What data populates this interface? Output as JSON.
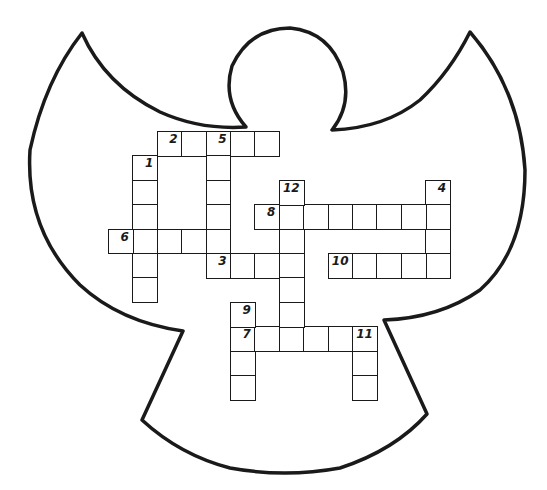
{
  "puzzle": {
    "shape": "angel",
    "grid": {
      "origin_x": 108,
      "origin_y": 131,
      "cell_size": 24.4,
      "columns": 14,
      "rows": 12
    },
    "entries": [
      {
        "number": "1",
        "direction": "down",
        "row": 1,
        "col": 1,
        "length": 6
      },
      {
        "number": "2",
        "direction": "across",
        "row": 0,
        "col": 2,
        "length": 5
      },
      {
        "number": "3",
        "direction": "across",
        "row": 5,
        "col": 4,
        "length": 4
      },
      {
        "number": "4",
        "direction": "down",
        "row": 2,
        "col": 13,
        "length": 4
      },
      {
        "number": "5",
        "direction": "down",
        "row": 0,
        "col": 4,
        "length": 6
      },
      {
        "number": "6",
        "direction": "across",
        "row": 4,
        "col": 0,
        "length": 5
      },
      {
        "number": "7",
        "direction": "across",
        "row": 8,
        "col": 5,
        "length": 6
      },
      {
        "number": "8",
        "direction": "across",
        "row": 3,
        "col": 6,
        "length": 8
      },
      {
        "number": "9",
        "direction": "down",
        "row": 7,
        "col": 5,
        "length": 4
      },
      {
        "number": "10",
        "direction": "across",
        "row": 5,
        "col": 9,
        "length": 5
      },
      {
        "number": "11",
        "direction": "down",
        "row": 8,
        "col": 10,
        "length": 3
      },
      {
        "number": "12",
        "direction": "down",
        "row": 2,
        "col": 7,
        "length": 7
      }
    ]
  },
  "colors": {
    "ink": "#1a1a1a",
    "paper": "#ffffff"
  }
}
